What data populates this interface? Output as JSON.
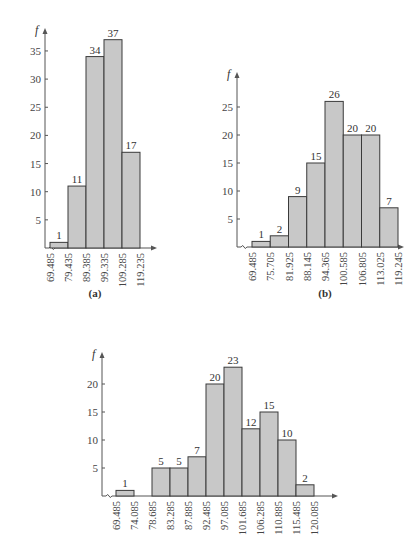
{
  "chart_data": [
    {
      "type": "bar",
      "title": "",
      "panel_label": "(a)",
      "xlabel": "",
      "ylabel": "f",
      "bin_edges": [
        "69.485",
        "79.435",
        "89.385",
        "99.335",
        "109.285",
        "119.235"
      ],
      "values": [
        1,
        11,
        34,
        37,
        17
      ],
      "yticks": [
        5,
        10,
        15,
        20,
        25,
        30,
        35
      ],
      "ylim": [
        0,
        38
      ],
      "grid": false,
      "axis_break": true
    },
    {
      "type": "bar",
      "title": "",
      "panel_label": "(b)",
      "xlabel": "",
      "ylabel": "f",
      "bin_edges": [
        "69.485",
        "75.705",
        "81.925",
        "88.145",
        "94.365",
        "100.585",
        "106.805",
        "113.025",
        "119.245"
      ],
      "values": [
        1,
        2,
        9,
        15,
        26,
        20,
        20,
        7
      ],
      "yticks": [
        5,
        10,
        15,
        20,
        25
      ],
      "ylim": [
        0,
        28
      ],
      "grid": false,
      "axis_break": true
    },
    {
      "type": "bar",
      "title": "",
      "panel_label": "",
      "xlabel": "",
      "ylabel": "f",
      "bin_edges": [
        "69.485",
        "74.085",
        "78.685",
        "83.285",
        "87.885",
        "92.485",
        "97.085",
        "101.685",
        "106.285",
        "110.885",
        "115.485",
        "120.085"
      ],
      "values": [
        1,
        0,
        5,
        5,
        7,
        20,
        23,
        12,
        15,
        10,
        2
      ],
      "value_labels": [
        "1",
        "",
        "5",
        "5",
        "7",
        "20",
        "23",
        "12",
        "15",
        "10",
        "2"
      ],
      "yticks": [
        5,
        10,
        15,
        20
      ],
      "ylim": [
        0,
        25
      ],
      "grid": false,
      "axis_break": true
    }
  ],
  "layout": [
    {
      "axis_x": 45,
      "base_y": 248,
      "px_per_unit": 5.63,
      "first_bar_x": 50,
      "bar_w": 18,
      "arrow_end": 157,
      "top_y": 28,
      "panel_y": 297
    },
    {
      "axis_x": 237,
      "base_y": 247,
      "px_per_unit": 5.6,
      "first_bar_x": 252,
      "bar_w": 18.25,
      "arrow_end": 404,
      "top_y": 72,
      "panel_y": 297
    },
    {
      "axis_x": 102,
      "base_y": 496,
      "px_per_unit": 5.6,
      "first_bar_x": 116,
      "bar_w": 18,
      "arrow_end": 338,
      "top_y": 352,
      "panel_y": null
    }
  ],
  "colors": {
    "bar_fill": "#c8c8c8",
    "bar_stroke": "#3a3a3a",
    "axis": "#555555"
  }
}
